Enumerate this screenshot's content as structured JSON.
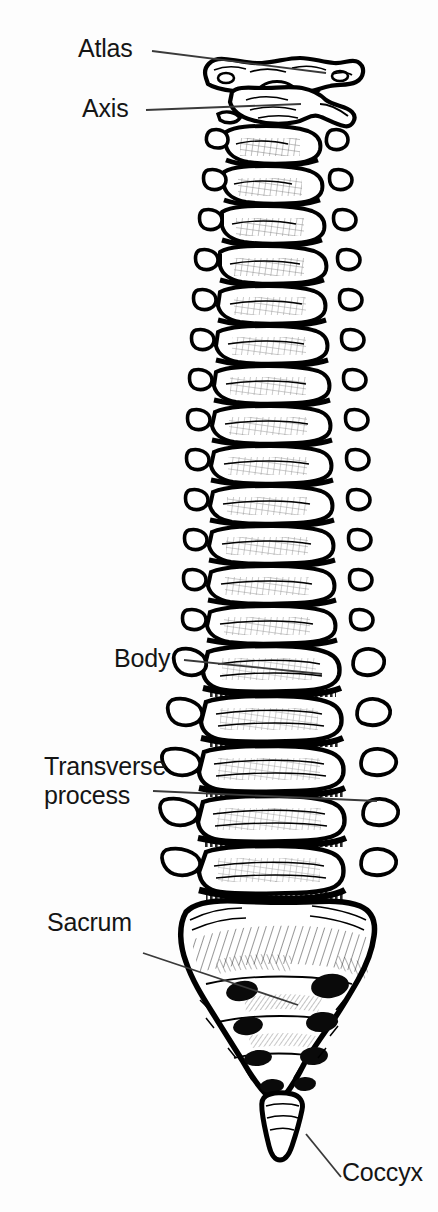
{
  "figure": {
    "background_color": "#ffffff",
    "ink_color": "#000000",
    "leader_line_color": "#3a3a3a",
    "width": 438,
    "height": 1212
  },
  "labels": [
    {
      "id": "atlas",
      "text": "Atlas",
      "x": 78,
      "y": 34,
      "align": "left"
    },
    {
      "id": "axis",
      "text": "Axis",
      "x": 82,
      "y": 94,
      "align": "left"
    },
    {
      "id": "body",
      "text": "Body",
      "x": 114,
      "y": 644,
      "align": "left"
    },
    {
      "id": "transverse_process_l1",
      "text": "Transverse",
      "x": 44,
      "y": 752,
      "align": "left"
    },
    {
      "id": "transverse_process_l2",
      "text": "process",
      "x": 44,
      "y": 781,
      "align": "left"
    },
    {
      "id": "sacrum",
      "text": "Sacrum",
      "x": 47,
      "y": 908,
      "align": "left"
    },
    {
      "id": "coccyx",
      "text": "Coccyx",
      "x": 342,
      "y": 1158,
      "align": "left"
    }
  ],
  "leader_lines": [
    {
      "id": "atlas-leader",
      "x1": 152,
      "y1": 51,
      "x2": 326,
      "y2": 73
    },
    {
      "id": "axis-leader",
      "x1": 146,
      "y1": 110,
      "x2": 301,
      "y2": 104
    },
    {
      "id": "body-leader",
      "x1": 184,
      "y1": 660,
      "x2": 322,
      "y2": 674
    },
    {
      "id": "transverse-leader",
      "x1": 153,
      "y1": 791,
      "x2": 377,
      "y2": 801
    },
    {
      "id": "sacrum-leader",
      "x1": 143,
      "y1": 953,
      "x2": 298,
      "y2": 1005
    },
    {
      "id": "coccyx-leader",
      "x1": 306,
      "y1": 1134,
      "x2": 341,
      "y2": 1177
    }
  ],
  "anatomy": {
    "regions": [
      {
        "name": "cervical",
        "label": "Cervical vertebrae",
        "count": 7,
        "y_top": 58,
        "y_bottom": 258
      },
      {
        "name": "thoracic",
        "label": "Thoracic vertebrae",
        "count": 12,
        "y_top": 258,
        "y_bottom": 652
      },
      {
        "name": "lumbar",
        "label": "Lumbar vertebrae",
        "count": 5,
        "y_top": 652,
        "y_bottom": 905
      },
      {
        "name": "sacrum",
        "label": "Sacrum",
        "count": 1,
        "y_top": 905,
        "y_bottom": 1105
      },
      {
        "name": "coccyx",
        "label": "Coccyx",
        "count": 1,
        "y_top": 1105,
        "y_bottom": 1160
      }
    ],
    "sacral_foramina_pairs": 4,
    "view": "anterior"
  }
}
